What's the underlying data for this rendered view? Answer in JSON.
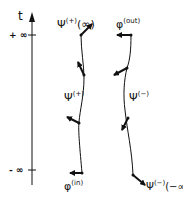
{
  "diagram": {
    "axis": {
      "label": "t",
      "top_tick": "+ ∞",
      "bottom_tick": "- ∞"
    },
    "left_curve": {
      "top_label": {
        "base": "Ψ",
        "sup": "(+)",
        "arg": "(∞)"
      },
      "mid_label": {
        "base": "Ψ",
        "sup": "(+)"
      },
      "bottom_label": {
        "base": "φ",
        "sup": "(in)"
      }
    },
    "right_curve": {
      "top_label": {
        "base": "φ",
        "sup": "(out)"
      },
      "mid_label": {
        "base": "Ψ",
        "sup": "(−)"
      },
      "bottom_label": {
        "base": "Ψ",
        "sup": "(−)",
        "arg": "(−∞)"
      }
    }
  }
}
